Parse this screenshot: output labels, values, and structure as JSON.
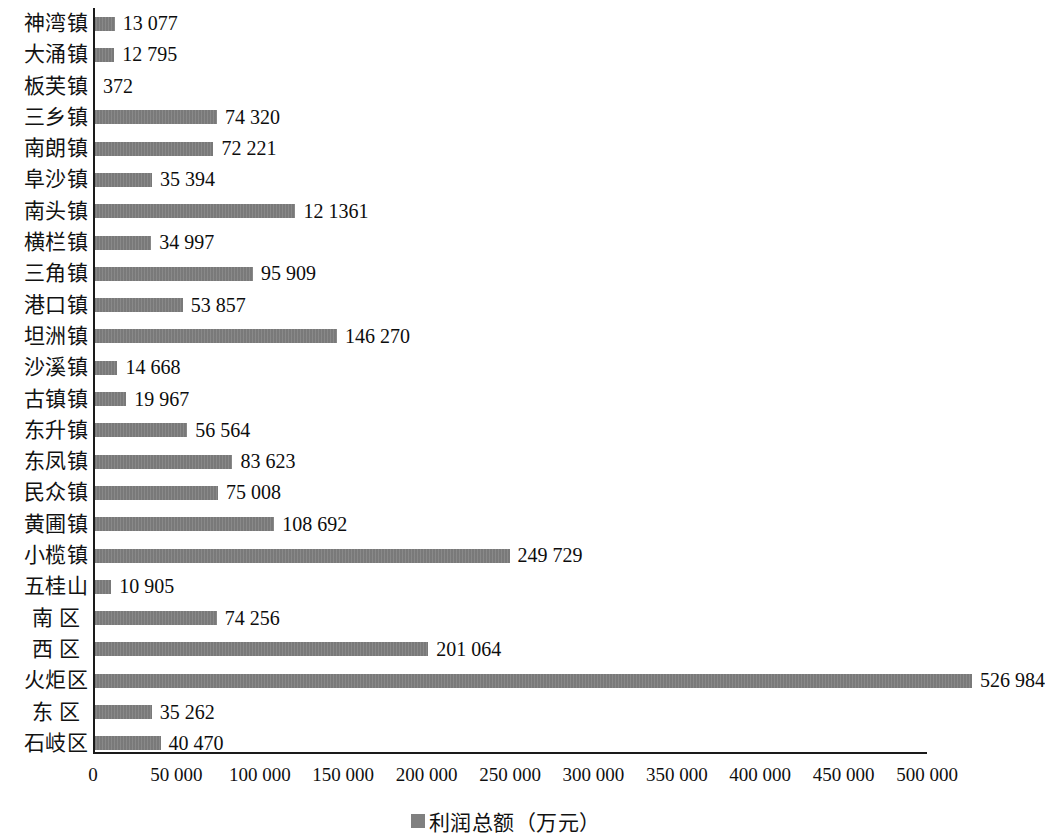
{
  "chart_data": {
    "type": "bar",
    "orientation": "horizontal",
    "title": "",
    "subtitle": "",
    "xlabel": "",
    "ylabel": "",
    "xlim": [
      0,
      500000
    ],
    "xtick_step": 50000,
    "grid": false,
    "legend_position": "bottom-center",
    "bar_color": "#808080",
    "axis_color": "#1a1a1a",
    "thousands_separator": " ",
    "legend": [
      {
        "name": "利润总额（万元）",
        "color": "#808080"
      }
    ],
    "categories": [
      "神湾镇",
      "大涌镇",
      "板芙镇",
      "三乡镇",
      "南朗镇",
      "阜沙镇",
      "南头镇",
      "横栏镇",
      "三角镇",
      "港口镇",
      "坦洲镇",
      "沙溪镇",
      "古镇镇",
      "东升镇",
      "东凤镇",
      "民众镇",
      "黄圃镇",
      "小榄镇",
      "五桂山",
      "南区",
      "西区",
      "火炬区",
      "东区",
      "石岐区"
    ],
    "values": [
      13077,
      12795,
      372,
      74320,
      72221,
      35394,
      121361,
      34997,
      95909,
      53857,
      146270,
      14668,
      19967,
      56564,
      83623,
      75008,
      108692,
      249729,
      10905,
      74256,
      201064,
      526984,
      35262,
      40470
    ],
    "value_labels": [
      "13 077",
      "12 795",
      "372",
      "74 320",
      "72 221",
      "35 394",
      "12 1361",
      "34 997",
      "95 909",
      "53 857",
      "146 270",
      "14 668",
      "19 967",
      "56 564",
      "83 623",
      "75 008",
      "108 692",
      "249 729",
      "10 905",
      "74 256",
      "201 064",
      "526 984",
      "35 262",
      "40 470"
    ],
    "xtick_labels": [
      "0",
      "50 000",
      "100 000",
      "150 000",
      "200 000",
      "250 000",
      "300 000",
      "350 000",
      "400 000",
      "450 000",
      "500 000"
    ],
    "xtick_values": [
      0,
      50000,
      100000,
      150000,
      200000,
      250000,
      300000,
      350000,
      400000,
      450000,
      500000
    ]
  }
}
